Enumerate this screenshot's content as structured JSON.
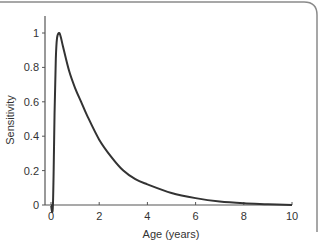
{
  "chart_data": {
    "type": "line",
    "title": "",
    "xlabel": "Age (years)",
    "ylabel": "Sensitivity",
    "xlim": [
      0,
      10
    ],
    "ylim": [
      0,
      1.1
    ],
    "grid": false,
    "legend": null,
    "x_ticks": [
      0,
      2,
      4,
      6,
      8,
      10
    ],
    "x_tick_labels": [
      "0",
      "2",
      "4",
      "6",
      "8",
      "10"
    ],
    "y_ticks": [
      0,
      0.2,
      0.4,
      0.6,
      0.8,
      1
    ],
    "y_tick_labels": [
      "0",
      "0.2",
      "0.4",
      "0.6",
      "0.8",
      "1"
    ],
    "series": [
      {
        "name": "Sensitivity",
        "color": "#333333",
        "x": [
          0.0,
          0.08,
          0.15,
          0.2,
          0.25,
          0.33,
          0.4,
          0.5,
          0.75,
          1.0,
          1.25,
          1.5,
          2.0,
          2.5,
          3.0,
          3.5,
          4.0,
          5.0,
          6.0,
          7.0,
          8.0,
          9.0,
          10.0
        ],
        "y": [
          0.0,
          0.0,
          0.55,
          0.85,
          0.97,
          1.0,
          0.98,
          0.92,
          0.78,
          0.68,
          0.6,
          0.52,
          0.38,
          0.28,
          0.2,
          0.15,
          0.12,
          0.07,
          0.04,
          0.02,
          0.01,
          0.005,
          0.0
        ]
      }
    ]
  },
  "frame": {
    "border_color": "#888888"
  }
}
